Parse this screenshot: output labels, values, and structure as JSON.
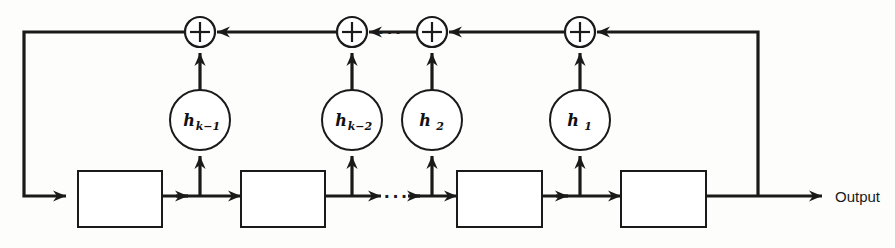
{
  "figure": {
    "type": "block-diagram",
    "background_color": "#fdfdfb",
    "line_color": "#1a1a1a",
    "width": 895,
    "height": 248
  },
  "labels": {
    "output": "Output",
    "ellipsis": "···"
  },
  "delay_blocks": [
    {
      "id": "delay-1",
      "label": "",
      "x": 78,
      "y": 171,
      "w": 84,
      "h": 56
    },
    {
      "id": "delay-2",
      "label": "",
      "x": 241,
      "y": 171,
      "w": 84,
      "h": 56
    },
    {
      "id": "delay-3",
      "label": "",
      "x": 457,
      "y": 171,
      "w": 85,
      "h": 56
    },
    {
      "id": "delay-4",
      "label": "",
      "x": 621,
      "y": 171,
      "w": 85,
      "h": 56
    }
  ],
  "gain_nodes": [
    {
      "id": "gain-k-1",
      "base": "h",
      "subscript": "k−1",
      "cx": 200,
      "cy": 120,
      "r": 30
    },
    {
      "id": "gain-k-2",
      "base": "h",
      "subscript": "k−2",
      "cx": 352,
      "cy": 120,
      "r": 30
    },
    {
      "id": "gain-2",
      "base": "h",
      "subscript": "2",
      "cx": 432,
      "cy": 120,
      "r": 30
    },
    {
      "id": "gain-1",
      "base": "h",
      "subscript": "1",
      "cx": 580,
      "cy": 120,
      "r": 30
    }
  ],
  "adders": [
    {
      "id": "adder-1",
      "symbol": "+",
      "cx": 200,
      "cy": 32,
      "r": 15
    },
    {
      "id": "adder-2",
      "symbol": "+",
      "cx": 352,
      "cy": 32,
      "r": 15
    },
    {
      "id": "adder-3",
      "symbol": "+",
      "cx": 432,
      "cy": 32,
      "r": 15
    },
    {
      "id": "adder-4",
      "symbol": "+",
      "cx": 580,
      "cy": 32,
      "r": 15
    }
  ],
  "taps": [
    {
      "id": "tap-1",
      "x": 200
    },
    {
      "id": "tap-2",
      "x": 352
    },
    {
      "id": "tap-3",
      "x": 432
    },
    {
      "id": "tap-4",
      "x": 580
    }
  ],
  "bus": {
    "signal_line_y": 196,
    "summation_line_y": 32,
    "left_return_x": 24,
    "right_feedback_x": 758,
    "output_arrow_end_x": 822,
    "output_label_x": 835,
    "output_label_y": 202
  },
  "ellipsis_positions": {
    "top_bus": {
      "x": 392,
      "y": 38
    },
    "bottom_bus": {
      "x": 398,
      "y": 203
    }
  }
}
